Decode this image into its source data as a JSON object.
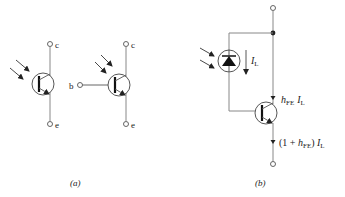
{
  "figure": {
    "panel_a": {
      "caption": "(a)",
      "symbol_two_terminal": {
        "collector_label": "c",
        "emitter_label": "e"
      },
      "symbol_three_terminal": {
        "base_label": "b",
        "collector_label": "c",
        "emitter_label": "e"
      }
    },
    "panel_b": {
      "caption": "(b)",
      "photodiode_current": {
        "symbol": "I",
        "subscript": "L"
      },
      "collector_current": {
        "prefix": "h",
        "prefix_sub": "FE",
        "symbol": "I",
        "subscript": "L"
      },
      "emitter_current": {
        "open": "(1 + ",
        "prefix": "h",
        "prefix_sub": "FE",
        "close": ") ",
        "symbol": "I",
        "subscript": "L"
      }
    },
    "colors": {
      "line": "#7a7a7a",
      "stroke_dark": "#222222",
      "background": "#ffffff"
    }
  }
}
